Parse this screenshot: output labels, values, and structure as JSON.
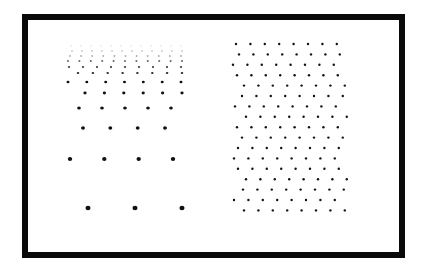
{
  "figure": {
    "frame_color": "#0a0a0a",
    "dot_color": "#111111",
    "left_pattern": {
      "name": "perspective-gradient-lattice",
      "rows": [
        {
          "y": 46,
          "x_start": 71,
          "x_end": 181,
          "count": 12,
          "r": 0.6,
          "opacity": 0.25
        },
        {
          "y": 51,
          "x_start": 72,
          "x_end": 182,
          "count": 12,
          "r": 0.7,
          "opacity": 0.35
        },
        {
          "y": 56,
          "x_start": 70,
          "x_end": 181,
          "count": 11,
          "r": 0.8,
          "opacity": 0.5
        },
        {
          "y": 61,
          "x_start": 68,
          "x_end": 182,
          "count": 11,
          "r": 0.9,
          "opacity": 0.65
        },
        {
          "y": 67,
          "x_start": 69,
          "x_end": 181,
          "count": 9,
          "r": 1.0,
          "opacity": 0.8
        },
        {
          "y": 73,
          "x_start": 78,
          "x_end": 182,
          "count": 8,
          "r": 1.1,
          "opacity": 0.9
        },
        {
          "y": 82,
          "x_start": 68,
          "x_end": 181,
          "count": 7,
          "r": 1.3,
          "opacity": 1
        },
        {
          "y": 93,
          "x_start": 85,
          "x_end": 182,
          "count": 6,
          "r": 1.4,
          "opacity": 1
        },
        {
          "y": 108,
          "x_start": 79,
          "x_end": 171,
          "count": 5,
          "r": 1.6,
          "opacity": 1
        },
        {
          "y": 128,
          "x_start": 83,
          "x_end": 165,
          "count": 4,
          "r": 1.7,
          "opacity": 1
        },
        {
          "y": 159,
          "x_start": 70,
          "x_end": 173,
          "count": 4,
          "r": 1.9,
          "opacity": 1
        },
        {
          "y": 208,
          "x_start": 88,
          "x_end": 182,
          "count": 3,
          "r": 2.2,
          "opacity": 1
        }
      ]
    },
    "right_pattern": {
      "name": "uniform-hexagonal-lattice",
      "row_start_y": 44,
      "row_spacing": 10.4,
      "row_count": 17,
      "cols": 8,
      "col_spacing": 14.4,
      "r": 1.2,
      "row_offsets": [
        236,
        239,
        233,
        237,
        244,
        242,
        235,
        246,
        237,
        242,
        238,
        234,
        238,
        246,
        243,
        234,
        244
      ]
    }
  }
}
